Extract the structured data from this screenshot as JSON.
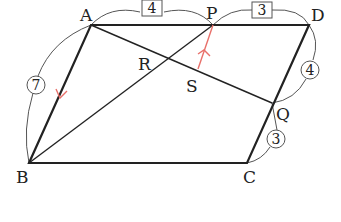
{
  "diagram": {
    "type": "parallelogram-geometry",
    "points": {
      "A": {
        "label": "A",
        "x": 91,
        "y": 25
      },
      "P": {
        "label": "P",
        "x": 213,
        "y": 25
      },
      "D": {
        "label": "D",
        "x": 309,
        "y": 25
      },
      "Q": {
        "label": "Q",
        "x": 272,
        "y": 103
      },
      "C": {
        "label": "C",
        "x": 247,
        "y": 163
      },
      "B": {
        "label": "B",
        "x": 29,
        "y": 163
      },
      "R": {
        "label": "R",
        "x": 169,
        "y": 60
      },
      "S": {
        "label": "S",
        "x": 197,
        "y": 70
      }
    },
    "segment_labels": {
      "AP": {
        "text": "4",
        "style": "box"
      },
      "PD": {
        "text": "3",
        "style": "box"
      },
      "AB": {
        "text": "7",
        "style": "circle"
      },
      "DQ": {
        "text": "4",
        "style": "circle"
      },
      "QC": {
        "text": "3",
        "style": "circle"
      }
    },
    "colors": {
      "line": "#222222",
      "thin_arc": "#555555",
      "arrow": "#e8706a"
    }
  }
}
